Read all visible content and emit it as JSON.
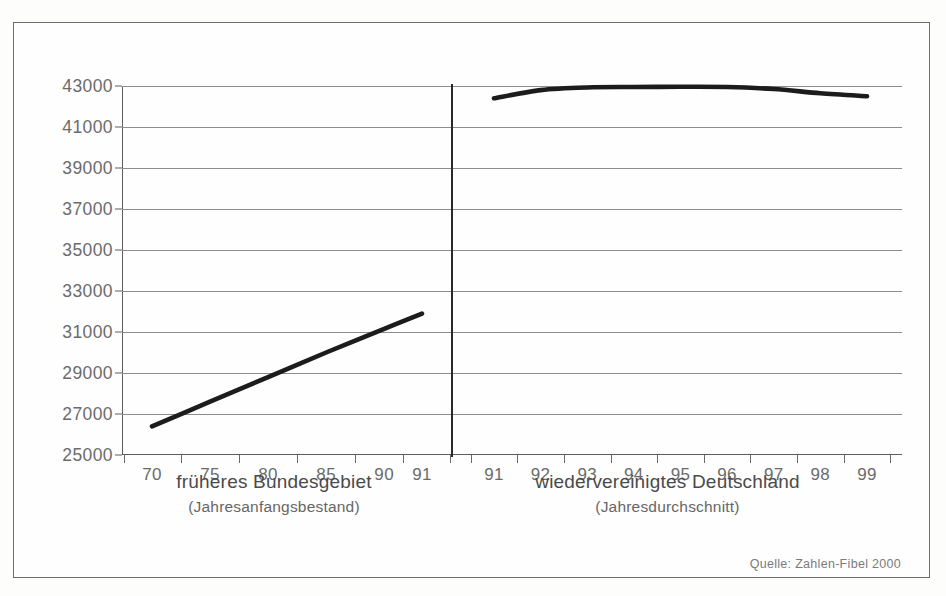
{
  "chart_data": {
    "type": "line",
    "title": "",
    "subtitle": "",
    "xlabel": "",
    "ylabel": "",
    "ylim": [
      25000,
      43000
    ],
    "ytick_step": 2000,
    "yticks": [
      25000,
      27000,
      29000,
      31000,
      33000,
      35000,
      37000,
      39000,
      41000,
      43000
    ],
    "grid": true,
    "legend": "none",
    "panels": [
      {
        "name": "frueheres-bundesgebiet",
        "caption": "früheres Bundesgebiet",
        "caption_sub": "(Jahresanfangsbestand)",
        "xticks": [
          "70",
          "75",
          "80",
          "85",
          "90",
          "91"
        ],
        "x": [
          70,
          75,
          80,
          85,
          90,
          91
        ],
        "values": [
          26400,
          27600,
          28800,
          30000,
          31150,
          31900
        ],
        "series_name": "früheres Bundesgebiet"
      },
      {
        "name": "wiedervereinigtes-deutschland",
        "caption": "wiedervereinigtes Deutschland",
        "caption_sub": "(Jahresdurchschnitt)",
        "xticks": [
          "91",
          "92",
          "93",
          "94",
          "95",
          "96",
          "97",
          "98",
          "99"
        ],
        "x": [
          91,
          92,
          93,
          94,
          95,
          96,
          97,
          98,
          99
        ],
        "values": [
          42400,
          42800,
          42930,
          42950,
          42960,
          42950,
          42850,
          42650,
          42500
        ],
        "series_name": "wiedervereinigtes Deutschland"
      }
    ],
    "source": "Quelle: Zahlen-Fibel 2000",
    "colors": {
      "line": "#1c1c1c",
      "grid": "#8d8d8d",
      "axis": "#5d5d5d",
      "text": "#6b6b6b",
      "frame": "#6e6e6e",
      "background": "#fefefe"
    }
  },
  "source_note": "Quelle: Zahlen-Fibel 2000"
}
